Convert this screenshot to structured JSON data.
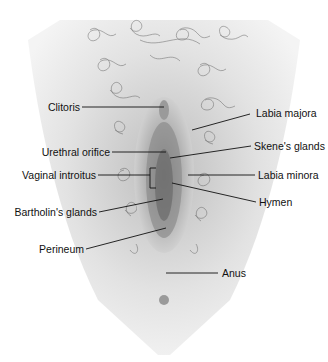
{
  "diagram": {
    "labels_left": [
      {
        "text": "Clitoris"
      },
      {
        "text": "Urethral orifice"
      },
      {
        "text": "Vaginal introitus"
      },
      {
        "text": "Bartholin's glands"
      },
      {
        "text": "Perineum"
      }
    ],
    "labels_right": [
      {
        "text": "Labia majora"
      },
      {
        "text": "Skene's glands"
      },
      {
        "text": "Labia minora"
      },
      {
        "text": "Hymen"
      },
      {
        "text": "Anus"
      }
    ]
  }
}
